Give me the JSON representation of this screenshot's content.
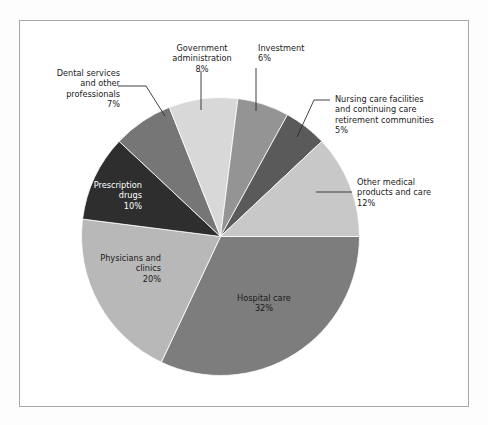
{
  "figure": {
    "background_color": "#fdfdfd",
    "panel_color": "#ffffff",
    "border_color": "#a8a8a8"
  },
  "chart_data": {
    "type": "pie",
    "title": "",
    "subtitle": "",
    "xlabel": "",
    "ylabel": "",
    "grid": false,
    "legend": "none",
    "units": "percent",
    "start_angle_deg": 0,
    "direction": "clockwise",
    "total": 100,
    "categories": [
      "Hospital care",
      "Physicians and clinics",
      "Prescription drugs",
      "Dental services and other professionals",
      "Government administration",
      "Investment",
      "Nursing care facilities and continuing care retirement communities",
      "Other medical products and care"
    ],
    "values": [
      32,
      20,
      10,
      7,
      8,
      6,
      5,
      12
    ],
    "colors": [
      "#7d7d7d",
      "#b8b8b8",
      "#2e2e2e",
      "#767676",
      "#d8d8d8",
      "#949494",
      "#5a5a5a",
      "#c8c8c8"
    ],
    "slices": [
      {
        "label": "Hospital care",
        "value": 32,
        "value_text": "32%",
        "color": "#7d7d7d",
        "label_placement": "inside",
        "label_color": "#1a1a1a",
        "text": "Hospital care\n32%"
      },
      {
        "label": "Physicians and clinics",
        "value": 20,
        "value_text": "20%",
        "color": "#b8b8b8",
        "label_placement": "inside",
        "label_color": "#1a1a1a",
        "text": "Physicians and\nclinics\n20%"
      },
      {
        "label": "Prescription drugs",
        "value": 10,
        "value_text": "10%",
        "color": "#2e2e2e",
        "label_placement": "inside",
        "label_color": "#ffffff",
        "text": "Prescription\ndrugs\n10%"
      },
      {
        "label": "Dental services and other professionals",
        "value": 7,
        "value_text": "7%",
        "color": "#767676",
        "label_placement": "outside",
        "label_color": "#1a1a1a",
        "text": "Dental services\nand other\nprofessionals\n7%"
      },
      {
        "label": "Government administration",
        "value": 8,
        "value_text": "8%",
        "color": "#d8d8d8",
        "label_placement": "outside",
        "label_color": "#1a1a1a",
        "text": "Government\nadministration\n8%"
      },
      {
        "label": "Investment",
        "value": 6,
        "value_text": "6%",
        "color": "#949494",
        "label_placement": "outside",
        "label_color": "#1a1a1a",
        "text": "Investment\n6%"
      },
      {
        "label": "Nursing care facilities and continuing care retirement communities",
        "value": 5,
        "value_text": "5%",
        "color": "#5a5a5a",
        "label_placement": "outside",
        "label_color": "#1a1a1a",
        "text": "Nursing care facilities\nand continuing care\nretirement communities\n5%"
      },
      {
        "label": "Other medical products and care",
        "value": 12,
        "value_text": "12%",
        "color": "#c8c8c8",
        "label_placement": "outside",
        "label_color": "#1a1a1a",
        "text": "Other medical\nproducts and care\n12%"
      }
    ]
  }
}
